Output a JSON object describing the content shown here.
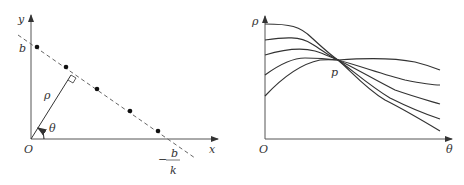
{
  "left_diagram": {
    "axis_labels": {
      "x": "x",
      "y": "y",
      "origin": "O"
    },
    "intercept_label": "b",
    "x_intercept": {
      "numerator": "b",
      "sign": "−",
      "denominator": "k"
    },
    "rho_label": "ρ",
    "theta_label": "θ",
    "dot_count": 5
  },
  "right_diagram": {
    "axis_labels": {
      "x": "θ",
      "y": "ρ",
      "origin": "O"
    },
    "intersection_label": "p",
    "curve_count": 5
  },
  "colors": {
    "line": "#333333",
    "dashed": "#666666",
    "axis": "#555555"
  }
}
